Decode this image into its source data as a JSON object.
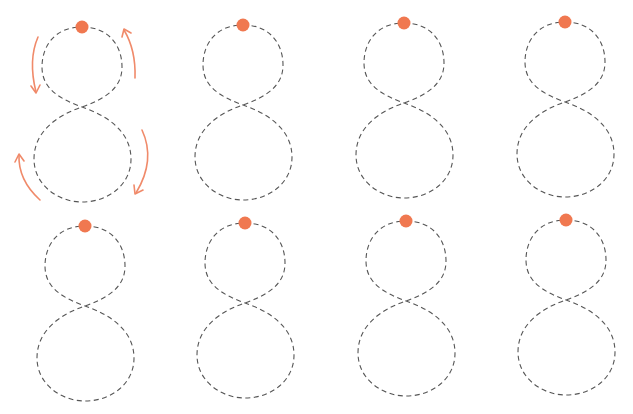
{
  "worksheet": {
    "title": "",
    "shape": "figure-eight tracing path",
    "colors": {
      "start_dot": "#f07850",
      "arrows": "#f08a6a",
      "dashed_path": "#555555",
      "background": "#ffffff"
    },
    "figures": [
      {
        "row": 1,
        "col": 1,
        "cx": 82,
        "top_y": 27,
        "has_arrows": true
      },
      {
        "row": 1,
        "col": 2,
        "cx": 243,
        "top_y": 25,
        "has_arrows": false
      },
      {
        "row": 1,
        "col": 3,
        "cx": 404,
        "top_y": 23,
        "has_arrows": false
      },
      {
        "row": 1,
        "col": 4,
        "cx": 565,
        "top_y": 22,
        "has_arrows": false
      },
      {
        "row": 2,
        "col": 1,
        "cx": 85,
        "top_y": 226,
        "has_arrows": false
      },
      {
        "row": 2,
        "col": 2,
        "cx": 245,
        "top_y": 223,
        "has_arrows": false
      },
      {
        "row": 2,
        "col": 3,
        "cx": 406,
        "top_y": 221,
        "has_arrows": false
      },
      {
        "row": 2,
        "col": 4,
        "cx": 566,
        "top_y": 220,
        "has_arrows": false
      }
    ],
    "direction_arrows": [
      {
        "position": "top-left",
        "direction": "down"
      },
      {
        "position": "top-right",
        "direction": "up"
      },
      {
        "position": "bottom-right",
        "direction": "down"
      },
      {
        "position": "bottom-left",
        "direction": "up"
      }
    ]
  }
}
